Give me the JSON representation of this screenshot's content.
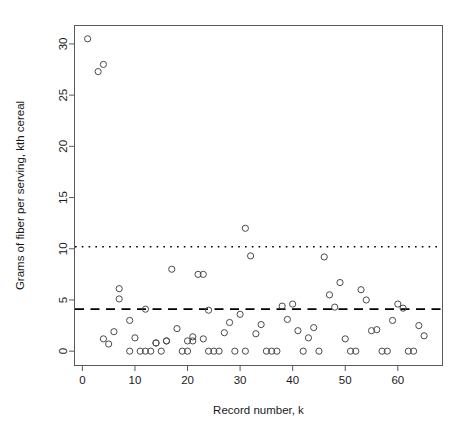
{
  "chart_data": {
    "type": "scatter",
    "title": "",
    "xlabel": "Record number, k",
    "ylabel": "Grams of fiber per serving, kth cereal",
    "xlim": [
      -1.5,
      68.5
    ],
    "ylim": [
      -1.4,
      31.8
    ],
    "xticks": [
      0,
      10,
      20,
      30,
      40,
      50,
      60
    ],
    "xtick_labels": [
      "0",
      "10",
      "20",
      "30",
      "40",
      "50",
      "60"
    ],
    "yticks": [
      0,
      5,
      10,
      15,
      20,
      25,
      30
    ],
    "ytick_labels": [
      "0",
      "5",
      "10",
      "15",
      "20",
      "25",
      "30"
    ],
    "grid": false,
    "legend": null,
    "marker": "open-circle",
    "marker_color": "#4a4a4a",
    "reference_lines": [
      {
        "name": "upper-dotted-line",
        "orientation": "horizontal",
        "y": 10.2,
        "style": "dotted",
        "color": "#000000"
      },
      {
        "name": "mean-dashed-line",
        "orientation": "horizontal",
        "y": 4.1,
        "style": "dashed",
        "color": "#000000"
      }
    ],
    "x": [
      1,
      3,
      4,
      4,
      5,
      6,
      7,
      7,
      9,
      9,
      10,
      11,
      12,
      12,
      13,
      14,
      14,
      15,
      16,
      16,
      17,
      18,
      19,
      20,
      20,
      21,
      21,
      22,
      23,
      23,
      24,
      24,
      25,
      26,
      27,
      28,
      29,
      30,
      31,
      31,
      32,
      33,
      34,
      35,
      36,
      37,
      38,
      39,
      40,
      41,
      42,
      43,
      44,
      45,
      46,
      47,
      48,
      49,
      50,
      51,
      52,
      53,
      54,
      55,
      56,
      57,
      58,
      59,
      60,
      61,
      62,
      63,
      64,
      65
    ],
    "y": [
      30.5,
      27.3,
      28.0,
      1.2,
      0.7,
      1.9,
      6.1,
      5.1,
      0.0,
      3.0,
      1.3,
      0.0,
      0.0,
      4.1,
      0.0,
      0.8,
      0.8,
      0.0,
      1.0,
      1.0,
      8.0,
      2.2,
      0.0,
      0.0,
      1.0,
      1.0,
      1.4,
      7.5,
      7.5,
      1.2,
      4.0,
      0.0,
      0.0,
      0.0,
      1.8,
      2.8,
      0.0,
      3.6,
      12.0,
      0.0,
      9.3,
      1.7,
      2.6,
      0.0,
      0.0,
      0.0,
      4.4,
      3.1,
      4.6,
      2.0,
      0.0,
      1.3,
      2.3,
      0.0,
      9.2,
      5.5,
      4.3,
      6.7,
      1.2,
      0.0,
      0.0,
      6.0,
      5.0,
      2.0,
      2.1,
      0.0,
      0.0,
      3.0,
      4.6,
      4.2,
      0.0,
      0.0,
      2.5,
      1.5
    ]
  },
  "figure": {
    "background_color": "#ffffff",
    "frame_color": "#5a5a5a",
    "text_color": "#1a1a1a"
  }
}
